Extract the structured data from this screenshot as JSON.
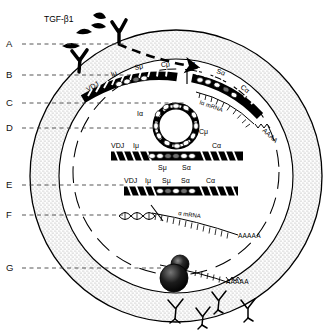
{
  "figure": {
    "ligand_label": "TGF-β1",
    "colors": {
      "ink": "#000000",
      "cytoplasm_stipple": "#b9b9b9",
      "background": "#ffffff"
    }
  },
  "stages": [
    {
      "id": "A",
      "label": "A"
    },
    {
      "id": "B",
      "label": "B"
    },
    {
      "id": "C",
      "label": "C"
    },
    {
      "id": "D",
      "label": "D"
    },
    {
      "id": "E",
      "label": "E"
    },
    {
      "id": "F",
      "label": "F"
    },
    {
      "id": "G",
      "label": "G"
    }
  ],
  "germline_locus": {
    "left_segments": [
      "VDJ",
      "Iμ",
      "Sμ",
      "Cμ"
    ],
    "right_segments": [
      "Iα",
      "Sα",
      "Cα"
    ],
    "transcript_label": "Iα mRNA",
    "transcript_tail": "AAAA"
  },
  "excision": {
    "circle_labels": [
      "Iα",
      "Cμ"
    ],
    "recombined_top": [
      "VDJ",
      "Iμ",
      "Cα"
    ],
    "recombined_bottom": [
      "Sμ",
      "Sα"
    ]
  },
  "switched_locus": {
    "segments": [
      "VDJ",
      "Iμ",
      "Sμ",
      "Sα",
      "Cα"
    ]
  },
  "transcription": {
    "mrna_label": "α mRNA",
    "poly_a_tail": "AAAAA"
  },
  "translation": {
    "poly_a_tail": "AAAAA",
    "ribosome": "ribosome",
    "secreted_product": "IgA antibody"
  }
}
